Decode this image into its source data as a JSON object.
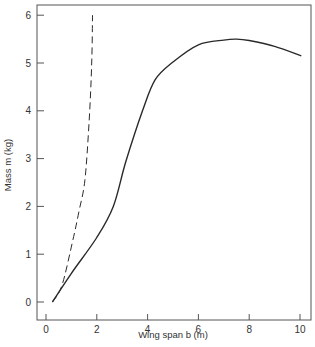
{
  "chart_data": {
    "type": "line",
    "title": "",
    "xlabel": "Wing span b (m)",
    "ylabel": "Mass m (kg)",
    "xlim": [
      0,
      10
    ],
    "ylim": [
      0,
      6
    ],
    "xticks": [
      0,
      2,
      4,
      6,
      8,
      10
    ],
    "yticks": [
      0,
      1,
      2,
      3,
      4,
      5,
      6
    ],
    "grid": false,
    "legend": null,
    "series": [
      {
        "name": "solid curve",
        "style": "solid",
        "x": [
          0.25,
          1.0,
          2.0,
          2.65,
          3.15,
          3.8,
          4.3,
          5.0,
          6.0,
          7.0,
          7.5,
          8.0,
          9.0,
          10.05
        ],
        "y": [
          0.0,
          0.6,
          1.35,
          2.0,
          2.95,
          4.0,
          4.65,
          5.02,
          5.38,
          5.48,
          5.5,
          5.47,
          5.35,
          5.15
        ]
      },
      {
        "name": "dashed curve",
        "style": "dashed",
        "x": [
          0.25,
          0.63,
          1.06,
          1.3,
          1.53,
          1.7,
          1.8,
          1.83
        ],
        "y": [
          0.0,
          0.35,
          1.3,
          1.9,
          2.55,
          3.8,
          5.0,
          6.0
        ]
      }
    ]
  },
  "axes": {
    "x_label": "Wing span b (m)",
    "y_label": "Mass m (kg)",
    "x_tick_labels": [
      "0",
      "2",
      "4",
      "6",
      "8",
      "10"
    ],
    "y_tick_labels": [
      "0",
      "1",
      "2",
      "3",
      "4",
      "5",
      "6"
    ]
  },
  "colors": {
    "line": "#2a2a2a",
    "frame": "#555555",
    "text": "#333333"
  }
}
